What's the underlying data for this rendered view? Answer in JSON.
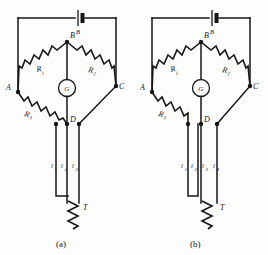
{
  "figure": {
    "background": "#fdfdfc",
    "ink": "#161616"
  },
  "panels": [
    {
      "id": "a",
      "caption": "(a)",
      "lead_count": 3,
      "nodes": [
        {
          "name": "A",
          "label": "A"
        },
        {
          "name": "B",
          "label": "B"
        },
        {
          "name": "C",
          "label": "C"
        },
        {
          "name": "D",
          "label": "D"
        }
      ],
      "resistors": [
        {
          "name": "R1",
          "label": "R",
          "sub": "1"
        },
        {
          "name": "R2",
          "label": "R",
          "sub": "2"
        },
        {
          "name": "R3",
          "label": "R",
          "sub": "3"
        }
      ],
      "leads": [
        {
          "name": "l1",
          "label": "l",
          "sub": "1"
        },
        {
          "name": "l2",
          "label": "l",
          "sub": "2"
        },
        {
          "name": "l3",
          "label": "l",
          "sub": "3"
        }
      ],
      "galvanometer": {
        "label": "G"
      },
      "battery": {
        "label": "B"
      },
      "sensor": {
        "label": "T"
      }
    },
    {
      "id": "b",
      "caption": "(b)",
      "lead_count": 4,
      "nodes": [
        {
          "name": "A",
          "label": "A"
        },
        {
          "name": "B",
          "label": "B"
        },
        {
          "name": "C",
          "label": "C"
        },
        {
          "name": "D",
          "label": "D"
        }
      ],
      "resistors": [
        {
          "name": "R1",
          "label": "R",
          "sub": "1"
        },
        {
          "name": "R2",
          "label": "R",
          "sub": "2"
        },
        {
          "name": "R3",
          "label": "R",
          "sub": "3"
        }
      ],
      "leads": [
        {
          "name": "l1",
          "label": "l",
          "sub": "1"
        },
        {
          "name": "l2",
          "label": "l",
          "sub": "2"
        },
        {
          "name": "l3",
          "label": "l",
          "sub": "3"
        },
        {
          "name": "l4",
          "label": "l",
          "sub": "4"
        }
      ],
      "galvanometer": {
        "label": "G"
      },
      "battery": {
        "label": "B"
      },
      "sensor": {
        "label": "T"
      }
    }
  ]
}
